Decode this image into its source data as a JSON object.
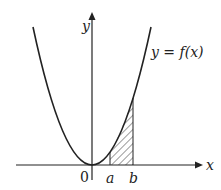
{
  "diagram": {
    "axes": {
      "x_label": "x",
      "y_label": "y",
      "origin_label": "0"
    },
    "curve": {
      "label": "y = f(x)",
      "shape": "parabola opening upward, vertex at origin"
    },
    "points": {
      "a": "a",
      "b": "b"
    },
    "shaded_region": "area under curve between x=a and x=b, hatched",
    "colors": {
      "line": "#222222",
      "background": "#ffffff"
    }
  }
}
